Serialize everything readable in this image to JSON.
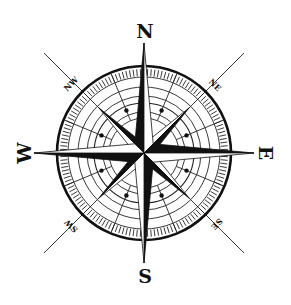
{
  "image": {
    "subject": "compass rose",
    "background": "#ffffff",
    "ink": "#111111"
  },
  "labels": {
    "north": "N",
    "south": "S",
    "east": "E",
    "west": "W",
    "northeast": "NE",
    "northwest": "NW",
    "southeast": "SE",
    "southwest": "SW"
  }
}
